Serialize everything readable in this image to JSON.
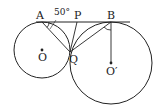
{
  "diagram": {
    "labels": {
      "A": "A",
      "P": "P",
      "B": "B",
      "Q": "Q",
      "O": "O",
      "O_prime": "O′",
      "angle": "50°"
    },
    "colors": {
      "stroke": "#222222",
      "background": "#ffffff"
    },
    "circles": [
      {
        "name": "circle-O",
        "cx": 42,
        "cy": 50,
        "r": 28
      },
      {
        "name": "circle-O-prime",
        "cx": 111,
        "cy": 62,
        "r": 41
      }
    ],
    "points": {
      "A": [
        42,
        22
      ],
      "P": [
        77,
        22
      ],
      "B": [
        111,
        22
      ],
      "Q": [
        70,
        52
      ],
      "O": [
        42,
        50
      ],
      "O_prime": [
        111,
        62
      ]
    },
    "angle_given": "50°"
  }
}
